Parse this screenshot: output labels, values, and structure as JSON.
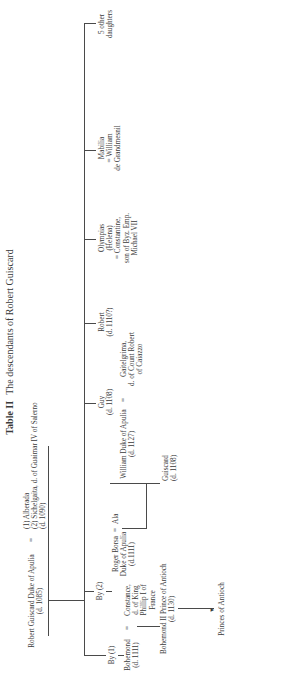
{
  "title": {
    "label": "Table II",
    "text": "The descendants of Robert Guiscard"
  },
  "root": {
    "name": "Robert Guiscard Duke of Apulia",
    "dates": "(d. 1085)",
    "marriage_symbol": "=",
    "spouses": [
      "(1) Alberada",
      "(2) Sichelgaita, d. of Guaimar IV of Salerno",
      "(d. 1090)"
    ]
  },
  "branches": {
    "by1": "By (1)",
    "by2": "By (2)"
  },
  "bohemond": {
    "name": "Bohemond",
    "dates": "(d. 1111)",
    "eq": "=",
    "spouse": [
      "Constance,",
      "d. of King",
      "Phillip I of",
      "France"
    ]
  },
  "bohemond2": {
    "name": "Bohemond II  Prince of Antioch",
    "dates": "(d. 1130)"
  },
  "antioch": "Princes of Antioch",
  "roger": {
    "name": "Roger Borsa",
    "title": "Duke of Apulia",
    "dates": "(d.1111)",
    "eq": "=",
    "spouse": "Ala"
  },
  "guiscard": {
    "name": "Guiscard",
    "dates": "(d. 1108)"
  },
  "william": {
    "name": "William Duke of Apulia",
    "dates": "(d. 1127)",
    "eq": "=",
    "spouse": [
      "Gaitelgrima,",
      "d. of Count Robert",
      "of Caiazzo"
    ]
  },
  "guy": {
    "name": "Guy",
    "dates": "(d. 1108)"
  },
  "robert": {
    "name": "Robert",
    "dates": "(d. 1110?)"
  },
  "olympias": {
    "lines": [
      "Olympias",
      "(Helena)",
      "= Constantine,",
      "son of Byz. Emp.",
      "Michael VII"
    ]
  },
  "mabilia": {
    "lines": [
      "Mabilia",
      "= William",
      "de Grandmesnil"
    ]
  },
  "others": {
    "lines": [
      "5 other",
      "daughters"
    ]
  }
}
